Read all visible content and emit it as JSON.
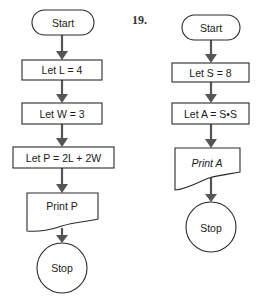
{
  "flowcharts": [
    {
      "number": "",
      "nodes": [
        {
          "type": "terminal",
          "label": "Start"
        },
        {
          "type": "process",
          "label": "Let L = 4"
        },
        {
          "type": "process",
          "label": "Let W = 3"
        },
        {
          "type": "process",
          "label": "Let P = 2L + 2W"
        },
        {
          "type": "output",
          "label": "Print P"
        },
        {
          "type": "connector",
          "label": "Stop"
        }
      ]
    },
    {
      "number": "19.",
      "nodes": [
        {
          "type": "terminal",
          "label": "Start"
        },
        {
          "type": "process",
          "label": "Let S = 8"
        },
        {
          "type": "process",
          "label": "Let A = S•S"
        },
        {
          "type": "output",
          "label": "Print A"
        },
        {
          "type": "connector",
          "label": "Stop"
        }
      ]
    }
  ]
}
